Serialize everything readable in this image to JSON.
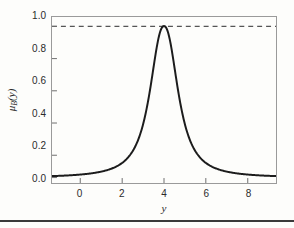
{
  "figure": {
    "background_color": "#fdfdfb",
    "frame_color": "#9a9a9a",
    "curve_color": "#1c1c1c",
    "dashed_color": "#555555",
    "rule_color": "#3a3a3a"
  },
  "axes": {
    "xlabel": "y",
    "ylabel_mu": "μ",
    "ylabel_sub": "B",
    "ylabel_arg": "(y)",
    "ylabel_full": "μB(y)",
    "xticks": [
      "0",
      "2",
      "4",
      "6",
      "8"
    ],
    "yticks": [
      "0.0",
      "0.2",
      "0.4",
      "0.6",
      "0.8",
      "1.0"
    ]
  },
  "chart_data": {
    "type": "line",
    "title": "",
    "subtitle": "",
    "xlabel": "y",
    "ylabel": "μB(y)",
    "xlim": [
      -1.35,
      9.35
    ],
    "ylim": [
      -0.035,
      1.06
    ],
    "xticks": [
      0,
      2,
      4,
      6,
      8
    ],
    "yticks": [
      0.0,
      0.2,
      0.4,
      0.6,
      0.8,
      1.0
    ],
    "grid": false,
    "legend": null,
    "annotations": [
      {
        "kind": "hline",
        "y": 1.0,
        "style": "dashed",
        "label": "membership degree = 1.0"
      }
    ],
    "series": [
      {
        "name": "μB(y)",
        "style": "solid",
        "color": "#1c1c1c",
        "description": "Bell-shaped (Cauchy/Lorentzian) fuzzy membership function centred at y = 4, peak value 1.0, half-width about 0.9, tails near 0.04",
        "x": [
          -1.0,
          -0.75,
          -0.5,
          -0.25,
          0.0,
          0.25,
          0.5,
          0.75,
          1.0,
          1.25,
          1.5,
          1.75,
          2.0,
          2.25,
          2.5,
          2.75,
          3.0,
          3.25,
          3.5,
          3.75,
          4.0,
          4.25,
          4.5,
          4.75,
          5.0,
          5.25,
          5.5,
          5.75,
          6.0,
          6.25,
          6.5,
          6.75,
          7.0,
          7.25,
          7.5,
          7.75,
          8.0,
          8.25,
          8.5,
          8.75,
          9.0
        ],
        "y": [
          0.039,
          0.043,
          0.047,
          0.052,
          0.058,
          0.064,
          0.072,
          0.081,
          0.093,
          0.107,
          0.125,
          0.148,
          0.178,
          0.219,
          0.275,
          0.354,
          0.468,
          0.628,
          0.822,
          0.967,
          1.0,
          0.967,
          0.822,
          0.628,
          0.468,
          0.354,
          0.275,
          0.219,
          0.178,
          0.148,
          0.125,
          0.107,
          0.093,
          0.081,
          0.072,
          0.064,
          0.058,
          0.052,
          0.047,
          0.043,
          0.039
        ]
      }
    ]
  }
}
